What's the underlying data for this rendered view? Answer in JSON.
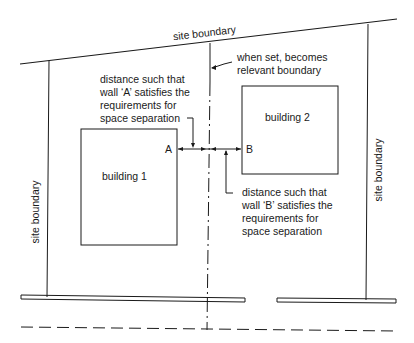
{
  "diagram": {
    "labels": {
      "top_boundary": "site boundary",
      "left_boundary": "site boundary",
      "right_boundary": "site boundary",
      "relevant_boundary": [
        "when set, becomes",
        "relevant boundary"
      ],
      "wall_a_note": [
        "distance such that",
        "wall ‘A’ satisfies the",
        "requirements for",
        "space separation"
      ],
      "wall_b_note": [
        "distance such that",
        "wall ‘B’ satisfies the",
        "requirements for",
        "space separation"
      ],
      "building_1": "building 1",
      "building_2": "building 2",
      "wall_a": "A",
      "wall_b": "B"
    },
    "colors": {
      "line": "#1a1a1a",
      "background": "#ffffff"
    }
  }
}
